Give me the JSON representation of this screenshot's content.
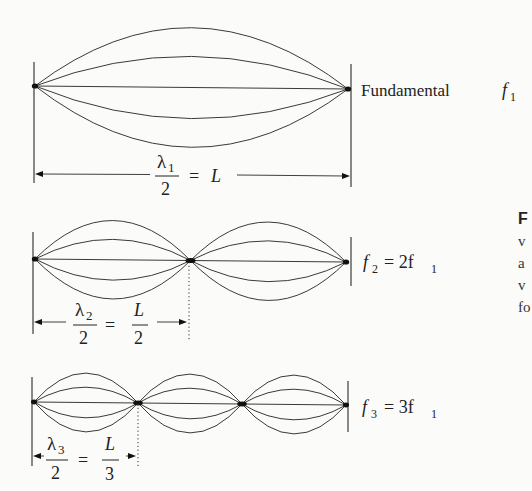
{
  "diagram": {
    "modes": [
      {
        "harmonic": 1,
        "loops": 1,
        "label_prefix": "Fundamental",
        "freq_symbol": "f",
        "freq_sub": "1",
        "freq_rhs": "",
        "wavelength": {
          "lambda": "λ",
          "lambda_sub": "1",
          "denominator": "2",
          "equals": "=",
          "rhs_num": "L",
          "rhs_den": ""
        }
      },
      {
        "harmonic": 2,
        "loops": 2,
        "label_prefix": "",
        "freq_symbol": "f",
        "freq_sub": "2",
        "freq_rhs": "= 2f",
        "freq_rhs_sub": "1",
        "wavelength": {
          "lambda": "λ",
          "lambda_sub": "2",
          "denominator": "2",
          "equals": "=",
          "rhs_num": "L",
          "rhs_den": "2"
        }
      },
      {
        "harmonic": 3,
        "loops": 3,
        "label_prefix": "",
        "freq_symbol": "f",
        "freq_sub": "3",
        "freq_rhs": "= 3f",
        "freq_rhs_sub": "1",
        "wavelength": {
          "lambda": "λ",
          "lambda_sub": "3",
          "denominator": "2",
          "equals": "=",
          "rhs_num": "L",
          "rhs_den": "3"
        }
      }
    ]
  },
  "caption_fragment": {
    "lines": [
      "F",
      "v",
      "a",
      "v",
      "fo"
    ]
  }
}
